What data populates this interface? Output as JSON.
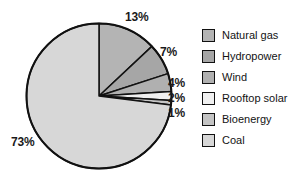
{
  "chart_data": {
    "type": "pie",
    "title": "",
    "labels": [
      "Natural gas",
      "Hydropower",
      "Wind",
      "Rooftop solar",
      "Bioenergy",
      "Coal"
    ],
    "values": [
      13,
      7,
      4,
      2,
      1,
      73
    ],
    "value_unit": "%",
    "data_labels": [
      "13%",
      "7%",
      "4%",
      "2%",
      "1%",
      "73%"
    ],
    "colors": [
      "#b4b4b4",
      "#a6a6a6",
      "#b0b0b0",
      "#f0f0f0",
      "#c4c4c4",
      "#d7d7d7"
    ],
    "legend_position": "right",
    "grid": false,
    "start_angle_deg": 0,
    "direction": "clockwise",
    "slices": [
      {
        "label": "Natural gas",
        "value": 13,
        "data_label": "13%",
        "color": "#b4b4b4"
      },
      {
        "label": "Hydropower",
        "value": 7,
        "data_label": "7%",
        "color": "#a6a6a6"
      },
      {
        "label": "Wind",
        "value": 4,
        "data_label": "4%",
        "color": "#b0b0b0"
      },
      {
        "label": "Rooftop solar",
        "value": 2,
        "data_label": "2%",
        "color": "#f0f0f0"
      },
      {
        "label": "Bioenergy",
        "value": 1,
        "data_label": "1%",
        "color": "#c4c4c4"
      },
      {
        "label": "Coal",
        "value": 73,
        "data_label": "73%",
        "color": "#d7d7d7"
      }
    ]
  },
  "legend": {
    "items": [
      {
        "label": "Natural gas",
        "color": "#b4b4b4"
      },
      {
        "label": "Hydropower",
        "color": "#a6a6a6"
      },
      {
        "label": "Wind",
        "color": "#b0b0b0"
      },
      {
        "label": "Rooftop solar",
        "color": "#f0f0f0"
      },
      {
        "label": "Bioenergy",
        "color": "#c4c4c4"
      },
      {
        "label": "Coal",
        "color": "#d7d7d7"
      }
    ]
  },
  "labels": {
    "natural_gas_pct": "13%",
    "hydropower_pct": "7%",
    "wind_pct": "4%",
    "rooftop_solar_pct": "2%",
    "bioenergy_pct": "1%",
    "coal_pct": "73%"
  }
}
